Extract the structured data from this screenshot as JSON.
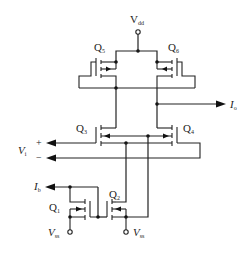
{
  "diagram": {
    "type": "CMOS operational transconductance amplifier schematic",
    "colors": {
      "line": "#222222",
      "background": "#ffffff"
    },
    "supply": {
      "vdd": {
        "label": "V",
        "sub": "dd"
      },
      "vss_left": {
        "label": "V",
        "sub": "ss"
      },
      "vss_right": {
        "label": "V",
        "sub": "ss"
      }
    },
    "transistors": [
      {
        "id": "Q5",
        "label": "Q",
        "sub": "5"
      },
      {
        "id": "Q6",
        "label": "Q",
        "sub": "6"
      },
      {
        "id": "Q3",
        "label": "Q",
        "sub": "3"
      },
      {
        "id": "Q4",
        "label": "Q",
        "sub": "4"
      },
      {
        "id": "Q2",
        "label": "Q",
        "sub": "2"
      },
      {
        "id": "Q1",
        "label": "Q",
        "sub": "1"
      }
    ],
    "ports": {
      "output": {
        "label": "I",
        "sub": "o"
      },
      "input": {
        "label": "V",
        "sub": "i",
        "plus": "+",
        "minus": "−"
      },
      "bias": {
        "label": "I",
        "sub": "b"
      }
    }
  }
}
